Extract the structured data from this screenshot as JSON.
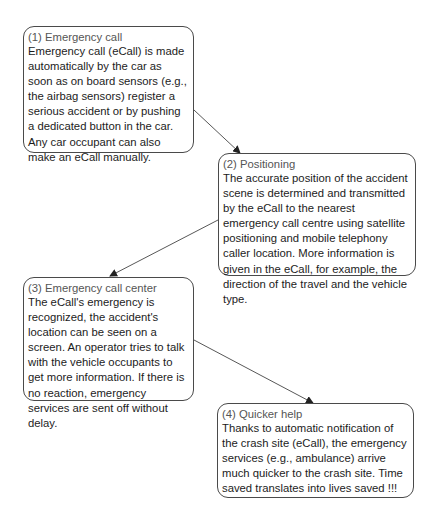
{
  "diagram": {
    "steps": [
      {
        "id": 1,
        "title": "(1) Emergency call",
        "body": "Emergency call (eCall) is made automatically by the car as soon as on board sensors (e.g., the airbag sensors) register a serious accident or by pushing a dedicated button in the car. Any car occupant can also make an eCall manually."
      },
      {
        "id": 2,
        "title": "(2) Positioning",
        "body": "The accurate position of the accident scene is determined and transmitted by the eCall to the nearest emergency call centre using satellite positioning and mobile telephony caller location. More information is given in the eCall, for example, the direction of the travel and the vehicle type."
      },
      {
        "id": 3,
        "title": "(3) Emergency call center",
        "body": "The eCall's emergency is recognized, the accident's location can be seen on a screen. An operator tries to talk with the vehicle occupants to get more information. If there is no reaction, emergency services are sent off without delay."
      },
      {
        "id": 4,
        "title": "(4) Quicker help",
        "body": "Thanks to automatic notification of the crash site (eCall), the emergency services (e.g., ambulance) arrive much quicker to the crash site. Time saved translates into lives saved !!!"
      }
    ],
    "connections": [
      {
        "from": 1,
        "to": 2
      },
      {
        "from": 2,
        "to": 3
      },
      {
        "from": 3,
        "to": 4
      }
    ],
    "colors": {
      "border": "#4a4a4a",
      "title_text": "#555555",
      "body_text": "#1c1c1c",
      "arrow": "#333333",
      "background": "#ffffff"
    }
  }
}
